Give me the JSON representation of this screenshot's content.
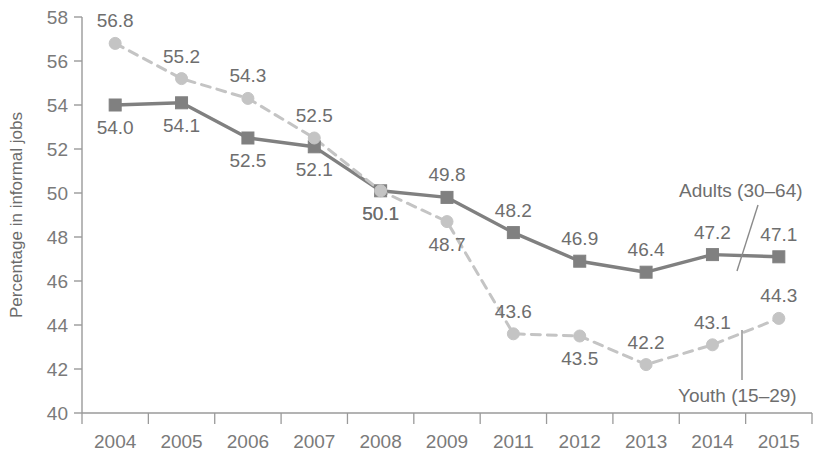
{
  "chart_data": {
    "type": "line",
    "title": "",
    "xlabel": "",
    "ylabel": "Percentage in informal jobs",
    "categories": [
      "2004",
      "2005",
      "2006",
      "2007",
      "2008",
      "2009",
      "2011",
      "2012",
      "2013",
      "2014",
      "2015"
    ],
    "ylim": [
      40,
      58
    ],
    "yticks": [
      40,
      42,
      44,
      46,
      48,
      50,
      52,
      54,
      56,
      58
    ],
    "ytick_labels": [
      "40",
      "42",
      "44",
      "46",
      "48",
      "50",
      "52",
      "54",
      "56",
      "58"
    ],
    "grid": false,
    "legend_position": "inline-annotation",
    "series": [
      {
        "name": "Adults (30–64)",
        "marker": "square",
        "line_style": "solid",
        "color": "#808080",
        "values": [
          54.0,
          54.1,
          52.5,
          52.1,
          50.1,
          49.8,
          48.2,
          46.9,
          46.4,
          47.2,
          47.1
        ],
        "value_labels": [
          "54.0",
          "54.1",
          "52.5",
          "52.1",
          "50.1",
          "49.8",
          "48.2",
          "46.9",
          "46.4",
          "47.2",
          "47.1"
        ],
        "label_positions": [
          "below",
          "below",
          "below",
          "below",
          "below",
          "above",
          "above",
          "above",
          "above",
          "above",
          "above"
        ]
      },
      {
        "name": "Youth (15–29)",
        "marker": "circle",
        "line_style": "dashed",
        "color": "#c4c4c4",
        "values": [
          56.8,
          55.2,
          54.3,
          52.5,
          50.1,
          48.7,
          43.6,
          43.5,
          42.2,
          43.1,
          44.3
        ],
        "value_labels": [
          "56.8",
          "55.2",
          "54.3",
          "52.5",
          "50.1",
          "48.7",
          "43.6",
          "43.5",
          "42.2",
          "43.1",
          "44.3"
        ],
        "label_positions": [
          "above",
          "above",
          "above",
          "above",
          "below",
          "below",
          "above",
          "below",
          "above",
          "above",
          "above"
        ]
      }
    ],
    "annotations": [
      {
        "text": "Adults (30–64)",
        "series": "Adults (30–64)"
      },
      {
        "text": "Youth (15–29)",
        "series": "Youth (15–29)"
      }
    ]
  }
}
